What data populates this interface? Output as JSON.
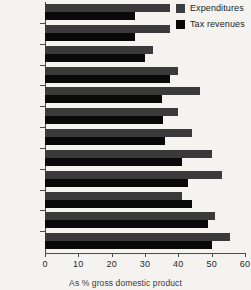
{
  "chart_data": {
    "type": "bar",
    "orientation": "horizontal",
    "title": "",
    "subtitle": "",
    "xlabel": "As % gross domestic product",
    "ylabel": "",
    "xlim": [
      0,
      60
    ],
    "xticks": [
      0,
      10,
      20,
      30,
      40,
      50,
      60
    ],
    "grid": false,
    "legend_position": "top-right",
    "categories": [
      "USA",
      "Japan",
      "Australia",
      "Canada",
      "Germany",
      "Spain",
      "UK",
      "Italy",
      "France",
      "Norway",
      "Denmark",
      "Sweden"
    ],
    "series": [
      {
        "name": "Expenditures",
        "color": "#3a3a3a",
        "values": [
          37.5,
          37.5,
          32.5,
          40,
          46.5,
          40,
          44,
          50,
          53,
          41,
          51,
          55.5
        ]
      },
      {
        "name": "Tax revenues",
        "color": "#090909",
        "values": [
          27,
          27,
          30,
          37.5,
          35,
          35.5,
          36,
          41,
          43,
          44,
          49,
          50
        ]
      }
    ]
  },
  "legend": {
    "items": [
      {
        "label": "Expenditures",
        "color": "#3a3a3a"
      },
      {
        "label": "Tax revenues",
        "color": "#090909"
      }
    ]
  },
  "caption": "As % gross domestic product"
}
